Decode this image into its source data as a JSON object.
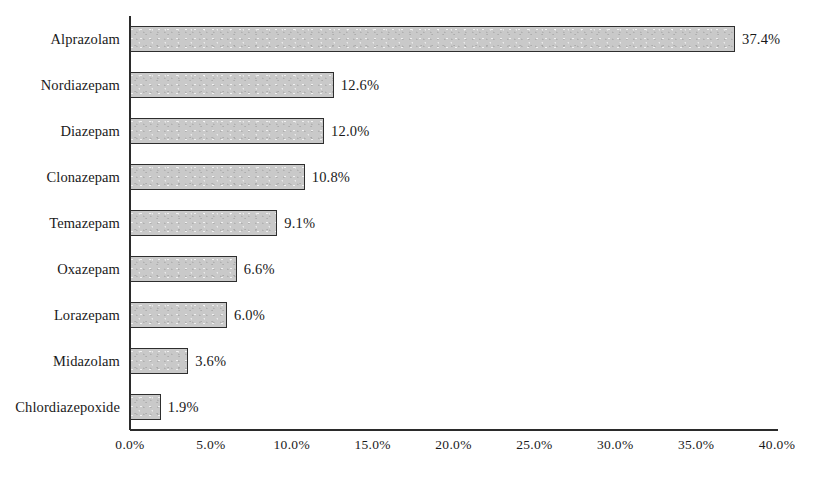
{
  "chart_data": {
    "type": "bar",
    "orientation": "horizontal",
    "title": "",
    "subtitle": "",
    "xlabel": "",
    "ylabel": "",
    "categories": [
      "Alprazolam",
      "Nordiazepam",
      "Diazepam",
      "Clonazepam",
      "Temazepam",
      "Oxazepam",
      "Lorazepam",
      "Midazolam",
      "Chlordiazepoxide"
    ],
    "values": [
      37.4,
      12.6,
      12.0,
      10.8,
      9.1,
      6.6,
      6.0,
      3.6,
      1.9
    ],
    "value_labels": [
      "37.4%",
      "12.6%",
      "12.0%",
      "10.8%",
      "9.1%",
      "6.6%",
      "6.0%",
      "3.6%",
      "1.9%"
    ],
    "xlim": [
      0.0,
      40.0
    ],
    "xticks": [
      0.0,
      5.0,
      10.0,
      15.0,
      20.0,
      25.0,
      30.0,
      35.0,
      40.0
    ],
    "xtick_labels": [
      "0.0%",
      "5.0%",
      "10.0%",
      "15.0%",
      "20.0%",
      "25.0%",
      "30.0%",
      "35.0%",
      "40.0%"
    ],
    "grid": false,
    "legend": null,
    "legend_position": "none",
    "colors": {
      "bar_fill": "#c9c9c9",
      "bar_border": "#2e2e2e",
      "axis": "#2b2b2b",
      "text": "#1a1a1a",
      "background": "#ffffff"
    }
  }
}
